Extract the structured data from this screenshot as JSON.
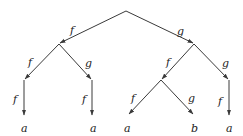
{
  "diagram": {
    "type": "tree",
    "nodes": [
      {
        "id": "root",
        "x": 126,
        "y": 11,
        "label": ""
      },
      {
        "id": "n1",
        "x": 59,
        "y": 44,
        "label": ""
      },
      {
        "id": "n2",
        "x": 194,
        "y": 44,
        "label": ""
      },
      {
        "id": "n3",
        "x": 24,
        "y": 80,
        "label": ""
      },
      {
        "id": "n4",
        "x": 92,
        "y": 80,
        "label": ""
      },
      {
        "id": "n5",
        "x": 162,
        "y": 80,
        "label": ""
      },
      {
        "id": "n6",
        "x": 229,
        "y": 80,
        "label": ""
      },
      {
        "id": "leaf1",
        "x": 24,
        "y": 118,
        "label": "a"
      },
      {
        "id": "leaf2",
        "x": 92,
        "y": 118,
        "label": "a"
      },
      {
        "id": "leaf3",
        "x": 128,
        "y": 118,
        "label": "a"
      },
      {
        "id": "leaf4",
        "x": 194,
        "y": 118,
        "label": "b"
      },
      {
        "id": "leaf5",
        "x": 229,
        "y": 118,
        "label": "a"
      }
    ],
    "edges": [
      {
        "from": "root",
        "to": "n1",
        "label": "f"
      },
      {
        "from": "root",
        "to": "n2",
        "label": "g"
      },
      {
        "from": "n1",
        "to": "n3",
        "label": "f"
      },
      {
        "from": "n1",
        "to": "n4",
        "label": "g"
      },
      {
        "from": "n3",
        "to": "leaf1",
        "label": "f"
      },
      {
        "from": "n4",
        "to": "leaf2",
        "label": "f"
      },
      {
        "from": "n2",
        "to": "n5",
        "label": "f"
      },
      {
        "from": "n2",
        "to": "n6",
        "label": "g"
      },
      {
        "from": "n5",
        "to": "leaf3",
        "label": "f"
      },
      {
        "from": "n5",
        "to": "leaf4",
        "label": "g"
      },
      {
        "from": "n6",
        "to": "leaf5",
        "label": "f"
      }
    ]
  },
  "labels": {
    "e_root_n1": "f",
    "e_root_n2": "g",
    "e_n1_n3": "f",
    "e_n1_n4": "g",
    "e_n3_l1": "f",
    "e_n4_l2": "f",
    "e_n2_n5": "f",
    "e_n2_n6": "g",
    "e_n5_l3": "f",
    "e_n5_l4": "g",
    "e_n6_l5": "f",
    "leaf1": "a",
    "leaf2": "a",
    "leaf3": "a",
    "leaf4": "b",
    "leaf5": "a"
  }
}
